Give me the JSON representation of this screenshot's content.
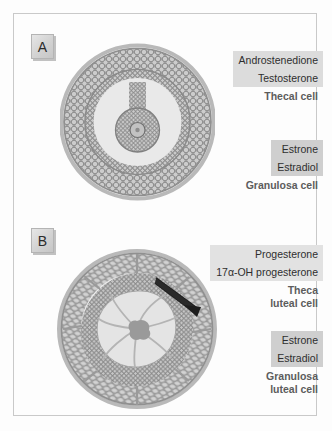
{
  "figure": {
    "background_color": "#fdfdfd",
    "frame_color": "#c9c9c9",
    "panels": [
      {
        "id": "A",
        "label": "A",
        "structure_name": "Graafian follicle",
        "label_groups": [
          {
            "id": "thecal",
            "hormones": [
              "Androstenedione",
              "Testosterone"
            ],
            "highlight_color": "#dcdcdc",
            "cell_type_lines": [
              "Thecal cell"
            ],
            "cell_type_color": "#5c5c5c"
          },
          {
            "id": "granulosa",
            "hormones": [
              "Estrone",
              "Estradiol"
            ],
            "highlight_color": "#cfcfcf",
            "cell_type_lines": [
              "Granulosa cell"
            ],
            "cell_type_color": "#5c5c5c"
          }
        ]
      },
      {
        "id": "B",
        "label": "B",
        "structure_name": "Corpus luteum",
        "label_groups": [
          {
            "id": "theca-luteal",
            "hormones": [
              "Progesterone",
              "17α-OH progesterone"
            ],
            "highlight_color": "#e2e2e2",
            "cell_type_lines": [
              "Theca",
              "luteal cell"
            ],
            "cell_type_color": "#5c5c5c"
          },
          {
            "id": "granulosa-luteal",
            "hormones": [
              "Estrone",
              "Estradiol"
            ],
            "highlight_color": "#cfcfcf",
            "cell_type_lines": [
              "Granulosa",
              "luteal cell"
            ],
            "cell_type_color": "#5c5c5c"
          }
        ]
      }
    ],
    "colors": {
      "theca_layer": "#9d9d9d",
      "granulosa_layer": "#8f8f8f",
      "antrum": "#e9e9e9",
      "cell_outline": "#7d7d7d",
      "cell_fill": "#c8c8c8",
      "basement_membrane": "#b8b8b8",
      "clot": "#9a9a9a",
      "arrow": "#1e1e1e"
    }
  }
}
